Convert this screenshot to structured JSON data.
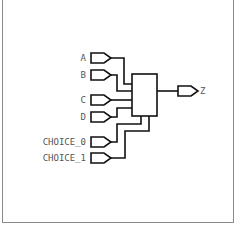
{
  "diagram": {
    "type": "multiplexer-schematic",
    "inputs": [
      {
        "label": "A",
        "y": 58
      },
      {
        "label": "B",
        "y": 75
      },
      {
        "label": "C",
        "y": 100
      },
      {
        "label": "D",
        "y": 117
      },
      {
        "label": "CHOICE_0",
        "y": 142
      },
      {
        "label": "CHOICE_1",
        "y": 158
      }
    ],
    "output": {
      "label": "Z"
    },
    "colors": {
      "stroke": "#111111",
      "label": "#555555",
      "border": "#8a8a8a"
    }
  }
}
